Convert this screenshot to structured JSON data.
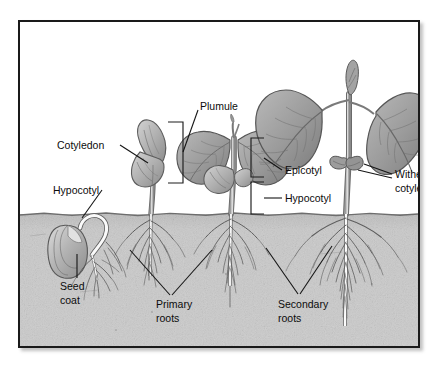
{
  "figure": {
    "frame_color": "#1a1a1a",
    "background_color": "#ffffff",
    "soil_color": "#c6c6c6",
    "soil_line_y": 212,
    "plant_color": "#8f8f8f"
  },
  "labels": {
    "cotyledon": "Cotyledon",
    "hypocotyl_left": "Hypocotyl",
    "seed_coat_line1": "Seed",
    "seed_coat_line2": "coat",
    "plumule": "Plumule",
    "epicotyl": "Epicotyl",
    "hypocotyl_right": "Hypocotyl",
    "withered_line1": "Withered",
    "withered_line2": "cotyledons",
    "primary_roots_line1": "Primary",
    "primary_roots_line2": "roots",
    "secondary_roots_line1": "Secondary",
    "secondary_roots_line2": "roots"
  },
  "stages": [
    {
      "name": "germinating-seed",
      "order": 1
    },
    {
      "name": "emerging-seedling",
      "order": 2
    },
    {
      "name": "young-seedling",
      "order": 3
    },
    {
      "name": "mature-seedling",
      "order": 4
    }
  ]
}
